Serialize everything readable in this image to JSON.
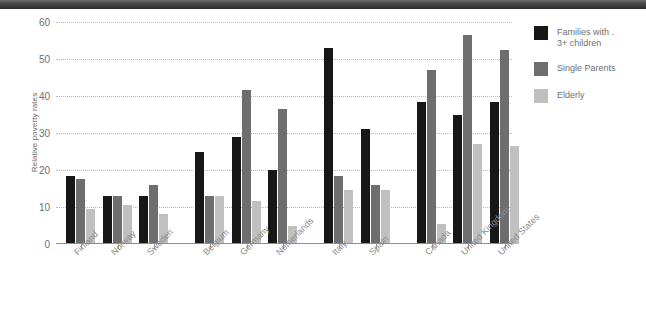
{
  "chart_data": {
    "type": "bar",
    "title": "",
    "xlabel": "",
    "ylabel": "Relative poverty rates",
    "ylim": [
      0,
      60
    ],
    "yticks": [
      0,
      10,
      20,
      30,
      40,
      50,
      60
    ],
    "grid": true,
    "legend_position": "right",
    "categories": [
      "Finland",
      "Norway",
      "Sweden",
      "Belgium",
      "Germany",
      "Netherlands",
      "Italy",
      "Spain",
      "Canada",
      "United Kingdom",
      "United States"
    ],
    "group_breaks": [
      3,
      6,
      8
    ],
    "series": [
      {
        "name": "Families with .\n3+ children",
        "color": "#171717",
        "values": [
          18.5,
          13,
          13,
          25,
          29,
          20,
          53,
          31,
          38.5,
          35,
          38.5
        ]
      },
      {
        "name": "Single Parents",
        "color": "#6e6e6e",
        "values": [
          17.5,
          13,
          16,
          13,
          41.5,
          36.5,
          18.5,
          16,
          47,
          56.5,
          52.5
        ]
      },
      {
        "name": "Elderly",
        "color": "#c0c0c0",
        "values": [
          9.5,
          10.5,
          8,
          13,
          11.5,
          5,
          14.5,
          14.5,
          5.5,
          27,
          26.5
        ]
      }
    ]
  },
  "legend": {
    "items": [
      {
        "label": "Families with .\n3+ children",
        "color": "#171717"
      },
      {
        "label": "Single Parents",
        "color": "#6e6e6e"
      },
      {
        "label": "Elderly",
        "color": "#c0c0c0"
      }
    ]
  },
  "axes": {
    "y_title": "Relative poverty rates"
  }
}
